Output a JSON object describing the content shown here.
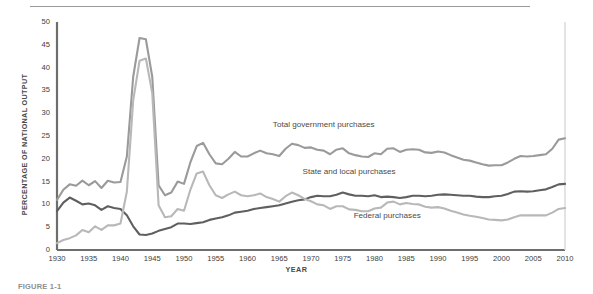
{
  "figure": {
    "caption": "FIGURE 1-1"
  },
  "chart_data": {
    "type": "line",
    "title": "",
    "xlabel": "YEAR",
    "ylabel": "PERCENTAGE OF NATIONAL OUTPUT",
    "xlim": [
      1930,
      2010
    ],
    "ylim": [
      0,
      50
    ],
    "ytick_step": 5,
    "xtick_step": 5,
    "grid": false,
    "legend_position": "inline-annotations",
    "ytick_labels": [
      "0",
      "5",
      "10",
      "15",
      "20",
      "25",
      "30",
      "35",
      "40",
      "45",
      "50"
    ],
    "xtick_labels": [
      "1930",
      "1935",
      "1940",
      "1945",
      "1950",
      "1955",
      "1960",
      "1965",
      "1970",
      "1975",
      "1980",
      "1985",
      "1990",
      "1995",
      "2000",
      "2005",
      "2010"
    ],
    "x": [
      1930,
      1931,
      1932,
      1933,
      1934,
      1935,
      1936,
      1937,
      1938,
      1939,
      1940,
      1941,
      1942,
      1943,
      1944,
      1945,
      1946,
      1947,
      1948,
      1949,
      1950,
      1951,
      1952,
      1953,
      1954,
      1955,
      1956,
      1957,
      1958,
      1959,
      1960,
      1961,
      1962,
      1963,
      1964,
      1965,
      1966,
      1967,
      1968,
      1969,
      1970,
      1971,
      1972,
      1973,
      1974,
      1975,
      1976,
      1977,
      1978,
      1979,
      1980,
      1981,
      1982,
      1983,
      1984,
      1985,
      1986,
      1987,
      1988,
      1989,
      1990,
      1991,
      1992,
      1993,
      1994,
      1995,
      1996,
      1997,
      1998,
      1999,
      2000,
      2001,
      2002,
      2003,
      2004,
      2005,
      2006,
      2007,
      2008,
      2009,
      2010
    ],
    "series": [
      {
        "name": "Total government purchases",
        "color": "#9a9a9a",
        "label_x": 1972,
        "label_y": 27.5,
        "values": [
          11.0,
          13.2,
          14.4,
          14.1,
          15.2,
          14.2,
          15.1,
          13.6,
          15.2,
          14.8,
          14.9,
          20.5,
          38.0,
          46.5,
          46.2,
          38.0,
          14.2,
          12.0,
          12.6,
          15.0,
          14.5,
          19.2,
          22.8,
          23.5,
          21.0,
          19.0,
          18.8,
          20.0,
          21.5,
          20.5,
          20.5,
          21.2,
          21.8,
          21.2,
          21.0,
          20.6,
          22.2,
          23.3,
          23.0,
          22.4,
          22.5,
          22.0,
          21.8,
          21.0,
          22.0,
          22.3,
          21.2,
          20.8,
          20.5,
          20.4,
          21.2,
          21.0,
          22.2,
          22.3,
          21.5,
          22.0,
          22.1,
          22.0,
          21.4,
          21.3,
          21.6,
          21.4,
          20.8,
          20.3,
          19.8,
          19.6,
          19.2,
          18.8,
          18.5,
          18.6,
          18.6,
          19.2,
          20.0,
          20.6,
          20.5,
          20.6,
          20.8,
          21.0,
          22.2,
          24.2,
          24.5
        ]
      },
      {
        "name": "State and local purchases",
        "color": "#5f5f5f",
        "label_x": 1976,
        "label_y": 17.0,
        "values": [
          8.5,
          10.4,
          11.5,
          10.8,
          10.0,
          10.2,
          9.8,
          8.8,
          9.6,
          9.2,
          9.0,
          7.6,
          5.2,
          3.4,
          3.3,
          3.6,
          4.2,
          4.6,
          5.0,
          5.8,
          5.8,
          5.7,
          5.9,
          6.1,
          6.6,
          6.9,
          7.2,
          7.6,
          8.2,
          8.4,
          8.6,
          9.0,
          9.2,
          9.4,
          9.6,
          9.8,
          10.2,
          10.6,
          10.9,
          11.1,
          11.6,
          11.9,
          11.8,
          11.8,
          12.1,
          12.6,
          12.2,
          11.9,
          11.9,
          11.8,
          12.0,
          11.6,
          11.7,
          11.6,
          11.4,
          11.6,
          11.9,
          11.9,
          11.8,
          11.9,
          12.1,
          12.2,
          12.1,
          12.0,
          11.9,
          11.9,
          11.7,
          11.6,
          11.6,
          11.8,
          11.9,
          12.3,
          12.8,
          12.9,
          12.8,
          12.9,
          13.1,
          13.3,
          13.8,
          14.4,
          14.5
        ]
      },
      {
        "name": "Federal purchases",
        "color": "#b8b8b8",
        "label_x": 1982,
        "label_y": 7.5,
        "values": [
          1.5,
          2.2,
          2.6,
          3.2,
          4.4,
          3.9,
          5.2,
          4.4,
          5.4,
          5.4,
          5.8,
          12.8,
          32.8,
          41.5,
          42.0,
          34.4,
          9.8,
          7.2,
          7.4,
          9.0,
          8.6,
          13.2,
          16.8,
          17.2,
          14.2,
          12.0,
          11.4,
          12.2,
          12.8,
          12.0,
          11.8,
          12.0,
          12.4,
          11.6,
          11.2,
          10.6,
          11.8,
          12.6,
          12.0,
          11.2,
          10.7,
          10.0,
          9.8,
          9.0,
          9.6,
          9.6,
          8.9,
          8.8,
          8.5,
          8.5,
          9.1,
          9.3,
          10.4,
          10.6,
          10.0,
          10.3,
          10.1,
          10.0,
          9.5,
          9.3,
          9.4,
          9.1,
          8.6,
          8.2,
          7.8,
          7.5,
          7.3,
          7.0,
          6.7,
          6.6,
          6.5,
          6.7,
          7.2,
          7.6,
          7.6,
          7.6,
          7.6,
          7.6,
          8.2,
          9.0,
          9.2
        ]
      }
    ]
  }
}
